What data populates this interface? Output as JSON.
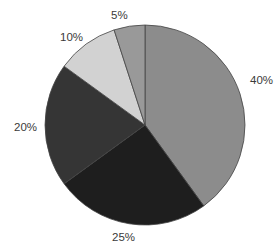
{
  "chart_data": {
    "type": "pie",
    "title": "",
    "start_angle_deg": 0,
    "direction": "clockwise",
    "categories": [
      "A",
      "B",
      "C",
      "D",
      "E"
    ],
    "values": [
      40,
      25,
      20,
      10,
      5
    ],
    "labels": [
      "40%",
      "25%",
      "20%",
      "10%",
      "5%"
    ],
    "colors": [
      "#8c8c8c",
      "#1e1e1e",
      "#353535",
      "#d2d2d2",
      "#999999"
    ],
    "legend": "none",
    "stroke": "#444444"
  },
  "labels": {
    "s0": "40%",
    "s1": "25%",
    "s2": "20%",
    "s3": "10%",
    "s4": "5%"
  }
}
